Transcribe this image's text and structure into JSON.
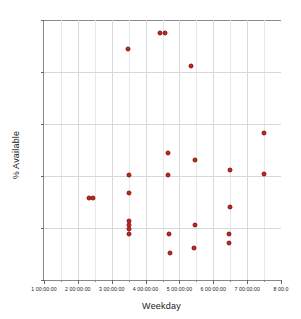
{
  "chart_data": {
    "type": "scatter",
    "title": "",
    "xlabel": "Weekday",
    "ylabel": "% Available",
    "xlim": [
      1.0,
      8.0
    ],
    "ylim": [
      0,
      1
    ],
    "grid": true,
    "legend": null,
    "marker_color": "#c0261c",
    "marker_edge_color": "#8a1a12",
    "y_ticks": [
      0,
      0.2,
      0.4,
      0.6,
      0.8,
      1
    ],
    "y_tick_labels": [
      "0",
      "0.2",
      "0.4",
      "0.6",
      "0.8",
      "1"
    ],
    "x_ticks": [
      1,
      2,
      3,
      4,
      5,
      6,
      7,
      8
    ],
    "x_tick_labels": [
      "1 00:00:00",
      "2 00:00:00",
      "3 00:00:00",
      "4 00:00:00",
      "5 00:00:00",
      "6 00:00:00",
      "7 00:00:00",
      "8 00:0"
    ],
    "x_minor_ticks": [
      1.5,
      2.5,
      3.5,
      4.5,
      5.5,
      6.5,
      7.5
    ],
    "points": [
      {
        "x": 2.34,
        "y": 0.317
      },
      {
        "x": 2.46,
        "y": 0.317
      },
      {
        "x": 3.48,
        "y": 0.89
      },
      {
        "x": 3.5,
        "y": 0.405
      },
      {
        "x": 3.5,
        "y": 0.335
      },
      {
        "x": 3.5,
        "y": 0.228
      },
      {
        "x": 3.5,
        "y": 0.212
      },
      {
        "x": 3.5,
        "y": 0.196
      },
      {
        "x": 3.5,
        "y": 0.178
      },
      {
        "x": 4.44,
        "y": 0.95
      },
      {
        "x": 4.56,
        "y": 0.95
      },
      {
        "x": 4.66,
        "y": 0.49
      },
      {
        "x": 4.66,
        "y": 0.405
      },
      {
        "x": 4.7,
        "y": 0.178
      },
      {
        "x": 4.72,
        "y": 0.105
      },
      {
        "x": 5.34,
        "y": 0.825
      },
      {
        "x": 5.46,
        "y": 0.46
      },
      {
        "x": 5.46,
        "y": 0.212
      },
      {
        "x": 5.44,
        "y": 0.125
      },
      {
        "x": 6.48,
        "y": 0.425
      },
      {
        "x": 6.5,
        "y": 0.281
      },
      {
        "x": 6.46,
        "y": 0.178
      },
      {
        "x": 6.46,
        "y": 0.142
      },
      {
        "x": 7.5,
        "y": 0.565
      },
      {
        "x": 7.5,
        "y": 0.408
      }
    ]
  }
}
